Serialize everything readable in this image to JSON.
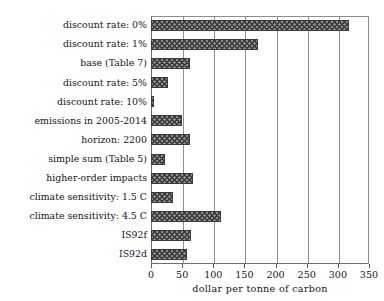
{
  "chart_data": {
    "type": "bar",
    "orientation": "horizontal",
    "title": "",
    "xlabel": "dollar per tonne of carbon",
    "ylabel": "",
    "xlim": [
      0,
      350
    ],
    "xticks": [
      0,
      50,
      100,
      150,
      200,
      250,
      300,
      350
    ],
    "grid": true,
    "legend": null,
    "bar_style": "cross-hatched",
    "categories": [
      "discount rate: 0%",
      "discount rate: 1%",
      "base (Table 7)",
      "discount rate: 5%",
      "discount rate: 10%",
      "emissions in 2005-2014",
      "horizon: 2200",
      "simple sum (Table 5)",
      "higher-order impacts",
      "climate sensitivity: 1.5 C",
      "climate sensitivity: 4.5 C",
      "IS92f",
      "IS92d"
    ],
    "values": [
      318,
      172,
      62,
      27,
      5,
      50,
      63,
      23,
      68,
      36,
      113,
      65,
      57
    ],
    "colors": {
      "bar_fill": "#8d8d8d",
      "bar_hatch": "#3d3d3d",
      "bar_edge": "#3a3a3a",
      "grid": "#8e8e8e",
      "axis": "#6e6e6e",
      "text": "#151515",
      "background": "#ffffff"
    }
  }
}
